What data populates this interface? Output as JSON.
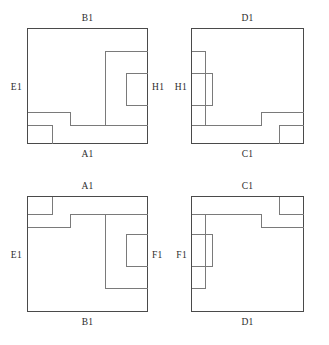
{
  "figure": {
    "title": "",
    "type": "geometric-diagram",
    "panel_count": 4,
    "stroke_color_outline": "#4a4a4a",
    "stroke_color_inner": "#7a7a7a",
    "background": "#ffffff"
  },
  "panels": [
    {
      "id": "top-left",
      "position": "top-left",
      "mirror": "none",
      "labels": {
        "top": "B1",
        "bottom": "A1",
        "left": "E1",
        "right": "H1"
      }
    },
    {
      "id": "top-right",
      "position": "top-right",
      "mirror": "horizontal",
      "labels": {
        "top": "D1",
        "bottom": "C1",
        "left": "H1",
        "right": ""
      }
    },
    {
      "id": "bottom-left",
      "position": "bottom-left",
      "mirror": "vertical",
      "labels": {
        "top": "A1",
        "bottom": "B1",
        "left": "E1",
        "right": "F1"
      }
    },
    {
      "id": "bottom-right",
      "position": "bottom-right",
      "mirror": "both",
      "labels": {
        "top": "C1",
        "bottom": "D1",
        "left": "F1",
        "right": ""
      }
    }
  ],
  "label_values": {
    "a1": "A1",
    "b1": "B1",
    "c1": "C1",
    "d1": "D1",
    "e1": "E1",
    "f1": "F1",
    "h1_left_panel": "H1",
    "h1_right_panel": "H1"
  }
}
